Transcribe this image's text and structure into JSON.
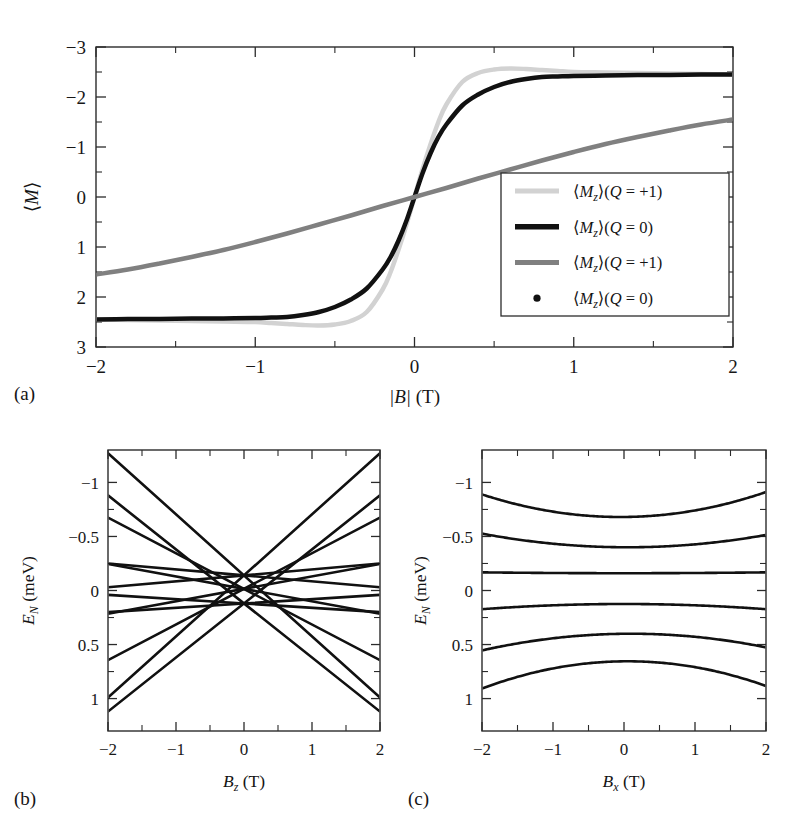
{
  "figure": {
    "width": 804,
    "height": 828,
    "background": "#ffffff",
    "panels": [
      "a",
      "b",
      "c"
    ]
  },
  "panel_a": {
    "label": "(a)",
    "xlabel_parts": {
      "abs_open": "|",
      "sym": "B",
      "abs_close": "|",
      "unit": "(T)"
    },
    "xlabel": "|B| (T)",
    "ylabel": "⟨M⟩",
    "ylabel_parts": {
      "bra": "⟨",
      "sym": "M",
      "ket": "⟩"
    },
    "xticks": [
      "-2",
      "-1",
      "0",
      "1",
      "2"
    ],
    "yticks": [
      "3",
      "2",
      "1",
      "0",
      "-1",
      "-2",
      "-3"
    ],
    "legend": {
      "entries": [
        {
          "label": "⟨M₂⟩(Q = +1)",
          "bra": "⟨",
          "sym": "M",
          "sub": "z",
          "ket": "⟩",
          "cond": "(Q = +1)",
          "color": "#d2d2d2",
          "marker": "line",
          "width": 5
        },
        {
          "label": "⟨M₂⟩(Q = 0)",
          "bra": "⟨",
          "sym": "M",
          "sub": "z",
          "ket": "⟩",
          "cond": "(Q = 0)",
          "color": "#111111",
          "marker": "line",
          "width": 5.5
        },
        {
          "label": "⟨M₂⟩(Q = +1)",
          "bra": "⟨",
          "sym": "M",
          "sub": "z",
          "ket": "⟩",
          "cond": "(Q = +1)",
          "color": "#808080",
          "marker": "line",
          "width": 5
        },
        {
          "label": "⟨M₂⟩(Q = 0)",
          "bra": "⟨",
          "sym": "M",
          "sub": "z",
          "ket": "⟩",
          "cond": "(Q = 0)",
          "color": "#111111",
          "marker": "dot",
          "width": 5
        }
      ]
    }
  },
  "panel_b": {
    "label": "(b)",
    "xlabel": "B_z (T)",
    "xlabel_parts": {
      "sym": "B",
      "sub": "z",
      "unit": "(T)"
    },
    "ylabel": "E_N (meV)",
    "ylabel_parts": {
      "sym": "E",
      "sub": "N",
      "unit": "(meV)"
    },
    "xticks": [
      "-2",
      "-1",
      "0",
      "1",
      "2"
    ],
    "yticks": [
      "1",
      "0.5",
      "0",
      "-0.5",
      "-1"
    ]
  },
  "panel_c": {
    "label": "(c)",
    "xlabel": "B_x (T)",
    "xlabel_parts": {
      "sym": "B",
      "sub": "x",
      "unit": "(T)"
    },
    "ylabel": "E_N (meV)",
    "ylabel_parts": {
      "sym": "E",
      "sub": "N",
      "unit": "(meV)"
    },
    "xticks": [
      "-2",
      "-1",
      "0",
      "1",
      "2"
    ],
    "yticks": [
      "1",
      "0.5",
      "0",
      "-0.5",
      "-1"
    ]
  },
  "chart_data": [
    {
      "id": "panel_a",
      "type": "line",
      "title": "",
      "xlabel": "|B| (T)",
      "ylabel": "⟨M⟩",
      "xlim": [
        -2,
        2
      ],
      "ylim": [
        -3,
        3
      ],
      "xticks": [
        -2,
        -1,
        0,
        1,
        2
      ],
      "yticks": [
        -3,
        -2,
        -1,
        0,
        1,
        2,
        3
      ],
      "xminor": [
        -1.5,
        -0.5,
        0.5,
        1.5
      ],
      "yminor": [
        -2.5,
        -1.5,
        -0.5,
        0.5,
        1.5,
        2.5
      ],
      "grid": false,
      "legend_position": "lower right",
      "series": [
        {
          "name": "⟨M_z⟩(Q = +1)",
          "color": "#d2d2d2",
          "linewidth": 4.5,
          "x": [
            -2.0,
            -1.8,
            -1.6,
            -1.4,
            -1.2,
            -1.0,
            -0.9,
            -0.8,
            -0.7,
            -0.6,
            -0.5,
            -0.4,
            -0.3,
            -0.2,
            -0.15,
            -0.1,
            -0.05,
            0.0,
            0.05,
            0.1,
            0.15,
            0.2,
            0.3,
            0.4,
            0.5,
            0.6,
            0.7,
            0.8,
            0.9,
            1.0,
            1.2,
            1.4,
            1.6,
            1.8,
            2.0
          ],
          "y": [
            -2.45,
            -2.46,
            -2.47,
            -2.48,
            -2.49,
            -2.5,
            -2.52,
            -2.54,
            -2.56,
            -2.57,
            -2.55,
            -2.48,
            -2.3,
            -1.85,
            -1.5,
            -1.05,
            -0.55,
            0.0,
            0.55,
            1.05,
            1.5,
            1.85,
            2.3,
            2.48,
            2.55,
            2.57,
            2.56,
            2.54,
            2.52,
            2.5,
            2.49,
            2.48,
            2.47,
            2.46,
            2.45
          ]
        },
        {
          "name": "⟨M_z⟩(Q = 0)",
          "color": "#111111",
          "linewidth": 4.5,
          "x": [
            -2.0,
            -1.8,
            -1.6,
            -1.4,
            -1.2,
            -1.0,
            -0.9,
            -0.8,
            -0.7,
            -0.6,
            -0.5,
            -0.4,
            -0.3,
            -0.2,
            -0.15,
            -0.1,
            -0.05,
            0.0,
            0.05,
            0.1,
            0.15,
            0.2,
            0.3,
            0.4,
            0.5,
            0.6,
            0.7,
            0.8,
            0.9,
            1.0,
            1.2,
            1.4,
            1.6,
            1.8,
            2.0
          ],
          "y": [
            -2.45,
            -2.44,
            -2.44,
            -2.43,
            -2.43,
            -2.42,
            -2.41,
            -2.4,
            -2.36,
            -2.3,
            -2.2,
            -2.05,
            -1.83,
            -1.45,
            -1.2,
            -0.87,
            -0.47,
            0.0,
            0.47,
            0.87,
            1.2,
            1.45,
            1.83,
            2.05,
            2.2,
            2.3,
            2.36,
            2.4,
            2.41,
            2.42,
            2.43,
            2.44,
            2.44,
            2.45,
            2.45
          ]
        },
        {
          "name": "⟨M_z⟩(Q = +1)",
          "color": "#808080",
          "linewidth": 4.5,
          "x": [
            -2.0,
            -1.8,
            -1.6,
            -1.4,
            -1.2,
            -1.0,
            -0.8,
            -0.6,
            -0.4,
            -0.2,
            0.0,
            0.2,
            0.4,
            0.6,
            0.8,
            1.0,
            1.2,
            1.4,
            1.6,
            1.8,
            2.0
          ],
          "y": [
            -1.55,
            -1.45,
            -1.33,
            -1.2,
            -1.06,
            -0.9,
            -0.73,
            -0.55,
            -0.37,
            -0.18,
            0.0,
            0.18,
            0.37,
            0.55,
            0.73,
            0.9,
            1.06,
            1.2,
            1.33,
            1.45,
            1.55
          ]
        },
        {
          "name": "⟨M_z⟩(Q = 0)",
          "color": "#111111",
          "marker": "dot",
          "linewidth": 0,
          "x": [],
          "y": []
        }
      ]
    },
    {
      "id": "panel_b",
      "type": "line",
      "title": "",
      "xlabel": "B_z (T)",
      "ylabel": "E_N (meV)",
      "xlim": [
        -2,
        2
      ],
      "ylim": [
        -1.3,
        1.3
      ],
      "xticks": [
        -2,
        -1,
        0,
        1,
        2
      ],
      "yticks": [
        -1,
        -0.5,
        0,
        0.5,
        1
      ],
      "xminor": [
        -1.5,
        -0.5,
        0.5,
        1.5
      ],
      "yminor": [
        -0.75,
        -0.25,
        0.25,
        0.75
      ],
      "grid": false,
      "color": "#111111",
      "linewidth": 2.6,
      "description": "Zeeman energy levels: straight lines crossing, E = E0 + slope * Bz",
      "lines": [
        {
          "intercept": 0.14,
          "slope": 0.565
        },
        {
          "intercept": 0.14,
          "slope": -0.565
        },
        {
          "intercept": -0.12,
          "slope": 0.5
        },
        {
          "intercept": -0.12,
          "slope": -0.5
        },
        {
          "intercept": 0.015,
          "slope": 0.33
        },
        {
          "intercept": 0.015,
          "slope": -0.33
        },
        {
          "intercept": 0.015,
          "slope": 0.115
        },
        {
          "intercept": 0.015,
          "slope": -0.115
        },
        {
          "intercept": 0.14,
          "slope": 0.055
        },
        {
          "intercept": 0.14,
          "slope": -0.055
        },
        {
          "intercept": -0.12,
          "slope": 0.04
        },
        {
          "intercept": -0.12,
          "slope": -0.04
        }
      ]
    },
    {
      "id": "panel_c",
      "type": "line",
      "title": "",
      "xlabel": "B_x (T)",
      "ylabel": "E_N (meV)",
      "xlim": [
        -2,
        2
      ],
      "ylim": [
        -1.3,
        1.3
      ],
      "xticks": [
        -2,
        -1,
        0,
        1,
        2
      ],
      "yticks": [
        -1,
        -0.5,
        0,
        0.5,
        1
      ],
      "xminor": [
        -1.5,
        -0.5,
        0.5,
        1.5
      ],
      "yminor": [
        -0.75,
        -0.25,
        0.25,
        0.75
      ],
      "grid": false,
      "color": "#111111",
      "linewidth": 2.6,
      "description": "Energy levels vs transverse field; curved (avoided crossings)",
      "curves": [
        {
          "name": "level-1",
          "center": 0.68,
          "curvature": 0.055,
          "x0": -0.05,
          "edge": 0.91
        },
        {
          "name": "level-2",
          "center": 0.4,
          "curvature": 0.03,
          "x0": 0.05,
          "edge": 0.52
        },
        {
          "name": "level-3",
          "center": 0.16,
          "curvature": 0.002,
          "x0": 0.0,
          "edge": 0.17
        },
        {
          "name": "level-4",
          "center": -0.125,
          "curvature": -0.012,
          "x0": 0.0,
          "edge": -0.17
        },
        {
          "name": "level-5",
          "center": -0.4,
          "curvature": -0.035,
          "x0": 0.1,
          "edge": -0.54
        },
        {
          "name": "level-6",
          "center": -0.655,
          "curvature": -0.06,
          "x0": 0.05,
          "edge": -0.89
        }
      ]
    }
  ]
}
